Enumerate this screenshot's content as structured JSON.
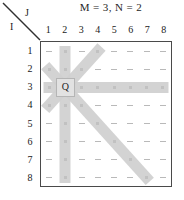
{
  "caption": "M = 3, N = 2",
  "axes": {
    "row_axis_label": "I",
    "col_axis_label": "J",
    "corner_icon": "diagonal-slash-icon"
  },
  "board": {
    "columns": [
      "1",
      "2",
      "3",
      "4",
      "5",
      "6",
      "7",
      "8"
    ],
    "rows": [
      "1",
      "2",
      "3",
      "4",
      "5",
      "6",
      "7",
      "8"
    ],
    "queen_label": "Q",
    "queen_row": 3,
    "queen_col": 2,
    "highlight_color": "#cfcfcf",
    "queen_cell_color": "#e2e2e2",
    "dot_color": "#1f1f1f",
    "dash_color": "#b9b9b9",
    "border_color": "#4a4a4a"
  },
  "chart_data": {
    "type": "heatmap",
    "title": "M = 3, N = 2",
    "xlabel": "J",
    "ylabel": "I",
    "categories": [
      "1",
      "2",
      "3",
      "4",
      "5",
      "6",
      "7",
      "8"
    ],
    "rows": [
      "1",
      "2",
      "3",
      "4",
      "5",
      "6",
      "7",
      "8"
    ],
    "grid": true,
    "legend": "none",
    "queen": {
      "row": 3,
      "col": 2,
      "label": "Q"
    },
    "attacked_cells": [
      [
        1,
        2
      ],
      [
        2,
        2
      ],
      [
        4,
        2
      ],
      [
        5,
        2
      ],
      [
        6,
        2
      ],
      [
        7,
        2
      ],
      [
        8,
        2
      ],
      [
        3,
        1
      ],
      [
        3,
        3
      ],
      [
        3,
        4
      ],
      [
        3,
        5
      ],
      [
        3,
        6
      ],
      [
        3,
        7
      ],
      [
        3,
        8
      ],
      [
        2,
        1
      ],
      [
        4,
        1
      ],
      [
        2,
        3
      ],
      [
        1,
        4
      ],
      [
        4,
        3
      ],
      [
        5,
        4
      ],
      [
        6,
        5
      ],
      [
        7,
        6
      ],
      [
        8,
        7
      ]
    ],
    "rays": [
      {
        "name": "up",
        "cells": [
          [
            2,
            2
          ],
          [
            1,
            2
          ]
        ]
      },
      {
        "name": "down",
        "cells": [
          [
            4,
            2
          ],
          [
            5,
            2
          ],
          [
            6,
            2
          ],
          [
            7,
            2
          ],
          [
            8,
            2
          ]
        ]
      },
      {
        "name": "left",
        "cells": [
          [
            3,
            1
          ]
        ]
      },
      {
        "name": "right",
        "cells": [
          [
            3,
            3
          ],
          [
            3,
            4
          ],
          [
            3,
            5
          ],
          [
            3,
            6
          ],
          [
            3,
            7
          ],
          [
            3,
            8
          ]
        ]
      },
      {
        "name": "up-left",
        "cells": [
          [
            2,
            1
          ]
        ]
      },
      {
        "name": "up-right",
        "cells": [
          [
            2,
            3
          ],
          [
            1,
            4
          ]
        ]
      },
      {
        "name": "down-left",
        "cells": [
          [
            4,
            1
          ]
        ]
      },
      {
        "name": "down-right",
        "cells": [
          [
            4,
            3
          ],
          [
            5,
            4
          ],
          [
            6,
            5
          ],
          [
            7,
            6
          ],
          [
            8,
            7
          ]
        ]
      }
    ],
    "values": [
      [
        0,
        1,
        0,
        1,
        0,
        0,
        0,
        0
      ],
      [
        1,
        1,
        1,
        0,
        0,
        0,
        0,
        0
      ],
      [
        1,
        2,
        1,
        1,
        1,
        1,
        1,
        1
      ],
      [
        1,
        1,
        1,
        0,
        0,
        0,
        0,
        0
      ],
      [
        0,
        1,
        0,
        1,
        0,
        0,
        0,
        0
      ],
      [
        0,
        1,
        0,
        0,
        1,
        0,
        0,
        0
      ],
      [
        0,
        1,
        0,
        0,
        0,
        1,
        0,
        0
      ],
      [
        0,
        1,
        0,
        0,
        0,
        0,
        1,
        0
      ]
    ]
  }
}
